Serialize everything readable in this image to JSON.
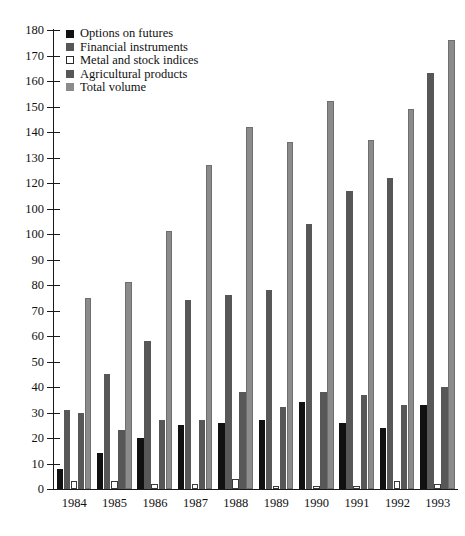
{
  "chart_data": {
    "type": "bar",
    "title": "",
    "subtitle": "",
    "xlabel": "",
    "ylabel": "",
    "categories": [
      "1984",
      "1985",
      "1986",
      "1987",
      "1988",
      "1989",
      "1990",
      "1991",
      "1992",
      "1993"
    ],
    "ylim": [
      0,
      180
    ],
    "ytick_step": 10,
    "yticks": [
      0,
      10,
      20,
      30,
      40,
      50,
      60,
      70,
      80,
      90,
      100,
      110,
      120,
      130,
      140,
      150,
      160,
      170,
      180
    ],
    "ytick_labels": [
      "0",
      "10",
      "20",
      "30",
      "40",
      "50",
      "60",
      "70",
      "80",
      "90",
      "100",
      "100",
      "120",
      "130",
      "140",
      "150",
      "160",
      "170",
      "180"
    ],
    "grid": false,
    "legend_position": "top-left",
    "series": [
      {
        "name": "Options on futures",
        "color": "#111111",
        "values": [
          8,
          14,
          20,
          25,
          26,
          27,
          34,
          26,
          24,
          33
        ]
      },
      {
        "name": "Financial instruments",
        "color": "#575757",
        "values": [
          31,
          45,
          58,
          74,
          76,
          78,
          104,
          117,
          122,
          163
        ]
      },
      {
        "name": "Metal and stock indices",
        "color": "#ffffff",
        "values": [
          3,
          3,
          2,
          2,
          4,
          1,
          1,
          1,
          3,
          2
        ]
      },
      {
        "name": "Agricultural products",
        "color": "#575757",
        "values": [
          30,
          23,
          27,
          27,
          38,
          32,
          38,
          37,
          33,
          40
        ]
      },
      {
        "name": "Total volume",
        "color": "#8b8b8b",
        "values": [
          75,
          81,
          101,
          127,
          142,
          136,
          152,
          137,
          149,
          176
        ]
      }
    ]
  },
  "legend": {
    "items": [
      {
        "label": "Options on futures",
        "swatch": "options-swatch"
      },
      {
        "label": "Financial instruments",
        "swatch": "financial-swatch"
      },
      {
        "label": "Metal and stock indices",
        "swatch": "metal-swatch"
      },
      {
        "label": "Agricultural products",
        "swatch": "agricultural-swatch"
      },
      {
        "label": "Total volume",
        "swatch": "total-swatch"
      }
    ]
  }
}
